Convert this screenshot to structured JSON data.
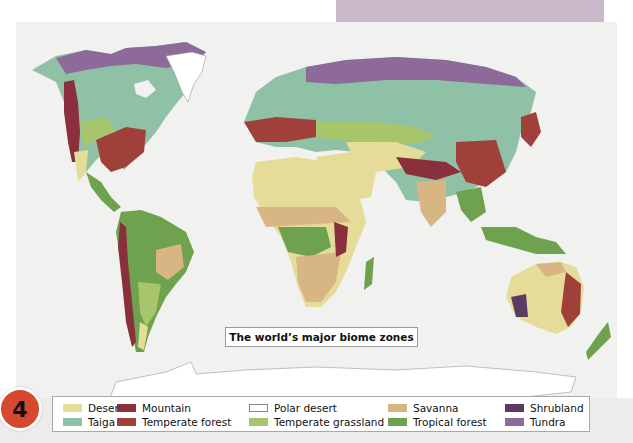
{
  "header": {
    "tab_color": "#c9b9c8"
  },
  "map": {
    "title": "The world’s major biome zones",
    "background": "#f1f1ef"
  },
  "badge": {
    "number": "4",
    "color": "#d54a2e"
  },
  "legend": {
    "items": [
      {
        "label": "Desert",
        "color": "#e6dc9a"
      },
      {
        "label": "Mountain",
        "color": "#8a2f3c"
      },
      {
        "label": "Polar desert",
        "color": "#ffffff"
      },
      {
        "label": "Savanna",
        "color": "#d7b683"
      },
      {
        "label": "Shrubland",
        "color": "#5b3a63"
      },
      {
        "label": "Taiga",
        "color": "#8fc1a6"
      },
      {
        "label": "Temperate forest",
        "color": "#a0403a"
      },
      {
        "label": "Temperate grassland",
        "color": "#a7c66b"
      },
      {
        "label": "Tropical forest",
        "color": "#6ea24e"
      },
      {
        "label": "Tundra",
        "color": "#8e6a9a"
      }
    ]
  }
}
